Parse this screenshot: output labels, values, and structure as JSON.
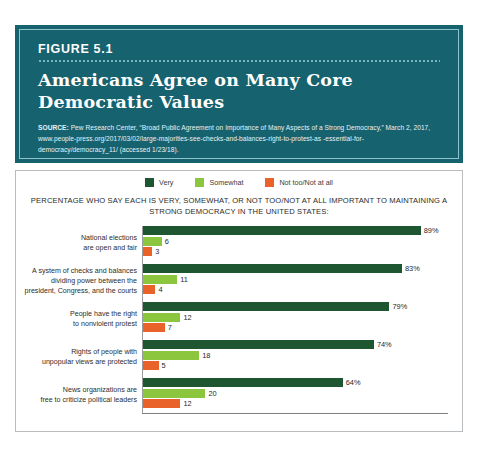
{
  "figure": {
    "label": "FIGURE 5.1",
    "title": "Americans Agree on Many Core Democratic Values",
    "source_lead": "SOURCE:",
    "source_text": " Pew Research Center, “Broad Public Agreement on Importance of Many Aspects of a Strong Democracy,” March 2, 2017, www.people-press.org/2017/03/02/large-majorities-see-checks-and-balances-right-to-protest-as -essential-for-democracy/democracy_11/ (accessed 1/23/18)."
  },
  "colors": {
    "header_teal": "#17626f",
    "header_inner_border": "#8fc3cc",
    "very": "#1f5632",
    "somewhat": "#8cc63e",
    "not_too": "#e8622a",
    "panel_border": "#b9bcbe",
    "axis": "#9a9d9f"
  },
  "chart_data": {
    "type": "bar",
    "orientation": "horizontal",
    "title": "Americans Agree on Many Core Democratic Values",
    "subtitle": "PERCENTAGE WHO SAY EACH IS VERY, SOMEWHAT, OR NOT TOO/NOT AT ALL IMPORTANT TO MAINTAINING A STRONG DEMOCRACY IN THE UNITED STATES:",
    "xlabel": "",
    "ylabel": "",
    "xlim": [
      0,
      100
    ],
    "grid": false,
    "legend_position": "top-center",
    "legend": [
      {
        "name": "Very",
        "color": "#1f5632"
      },
      {
        "name": "Somewhat",
        "color": "#8cc63e"
      },
      {
        "name": "Not too/Not at all",
        "color": "#e8622a"
      }
    ],
    "categories": [
      "National elections are open and fair",
      "A system of checks and balances dividing power between the president, Congress, and the courts",
      "People have the right to nonviolent protest",
      "Rights of people with unpopular views are protected",
      "News organizations are free to criticize political leaders"
    ],
    "series": [
      {
        "name": "Very",
        "color": "#1f5632",
        "values": [
          89,
          83,
          79,
          74,
          64
        ]
      },
      {
        "name": "Somewhat",
        "color": "#8cc63e",
        "values": [
          6,
          11,
          12,
          18,
          20
        ]
      },
      {
        "name": "Not too/Not at all",
        "color": "#e8622a",
        "values": [
          3,
          4,
          7,
          5,
          12
        ]
      }
    ]
  },
  "groups": [
    {
      "label_line1": "National elections",
      "label_line2": "are open and fair",
      "label_line3": "",
      "bars": [
        {
          "series": "Very",
          "value": 89,
          "display": "89%",
          "color": "#1f5632"
        },
        {
          "series": "Somewhat",
          "value": 6,
          "display": "6",
          "color": "#8cc63e"
        },
        {
          "series": "Not too/Not at all",
          "value": 3,
          "display": "3",
          "color": "#e8622a"
        }
      ]
    },
    {
      "label_line1": "A system of checks and balances",
      "label_line2": "dividing power between the",
      "label_line3": "president, Congress, and the courts",
      "bars": [
        {
          "series": "Very",
          "value": 83,
          "display": "83%",
          "color": "#1f5632"
        },
        {
          "series": "Somewhat",
          "value": 11,
          "display": "11",
          "color": "#8cc63e"
        },
        {
          "series": "Not too/Not at all",
          "value": 4,
          "display": "4",
          "color": "#e8622a"
        }
      ]
    },
    {
      "label_line1": "People have the right",
      "label_line2": "to nonviolent protest",
      "label_line3": "",
      "bars": [
        {
          "series": "Very",
          "value": 79,
          "display": "79%",
          "color": "#1f5632"
        },
        {
          "series": "Somewhat",
          "value": 12,
          "display": "12",
          "color": "#8cc63e"
        },
        {
          "series": "Not too/Not at all",
          "value": 7,
          "display": "7",
          "color": "#e8622a"
        }
      ]
    },
    {
      "label_line1": "Rights of people with",
      "label_line2": "unpopular views are protected",
      "label_line3": "",
      "bars": [
        {
          "series": "Very",
          "value": 74,
          "display": "74%",
          "color": "#1f5632"
        },
        {
          "series": "Somewhat",
          "value": 18,
          "display": "18",
          "color": "#8cc63e"
        },
        {
          "series": "Not too/Not at all",
          "value": 5,
          "display": "5",
          "color": "#e8622a"
        }
      ]
    },
    {
      "label_line1": "News organizations are",
      "label_line2": "free to criticize political leaders",
      "label_line3": "",
      "bars": [
        {
          "series": "Very",
          "value": 64,
          "display": "64%",
          "color": "#1f5632"
        },
        {
          "series": "Somewhat",
          "value": 20,
          "display": "20",
          "color": "#8cc63e"
        },
        {
          "series": "Not too/Not at all",
          "value": 12,
          "display": "12",
          "color": "#e8622a"
        }
      ]
    }
  ]
}
